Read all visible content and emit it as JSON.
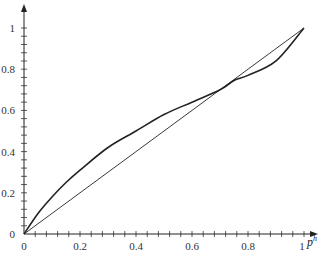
{
  "chart_data": {
    "type": "line",
    "title": "",
    "xlabel": "p^h",
    "ylabel": "",
    "xlim": [
      0,
      1
    ],
    "ylim": [
      0,
      1
    ],
    "grid": false,
    "x_ticks": [
      "0",
      "0.2",
      "0.4",
      "0.6",
      "0.8",
      "1"
    ],
    "y_ticks": [
      "0",
      "0.2",
      "0.4",
      "0.6",
      "0.8",
      "1"
    ],
    "minor_tick_step": 0.04,
    "series": [
      {
        "name": "curve",
        "style": "thick",
        "x": [
          0,
          0.05,
          0.1,
          0.15,
          0.2,
          0.3,
          0.4,
          0.5,
          0.6,
          0.7,
          0.75,
          0.8,
          0.9,
          1.0
        ],
        "y": [
          0,
          0.1,
          0.18,
          0.25,
          0.31,
          0.42,
          0.5,
          0.58,
          0.64,
          0.7,
          0.745,
          0.77,
          0.84,
          1.0
        ]
      },
      {
        "name": "45-degree line",
        "style": "thin",
        "x": [
          0,
          1
        ],
        "y": [
          0,
          1
        ]
      }
    ],
    "annotations": [
      {
        "text": "curve intersects diagonal",
        "x": 0.75,
        "y": 0.75
      }
    ]
  },
  "axis_labels": {
    "x_var_base": "p",
    "x_var_sup": "h"
  }
}
